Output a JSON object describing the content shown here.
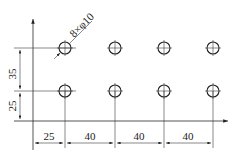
{
  "drawing": {
    "title": "Hole pattern dimension drawing",
    "hole_callout": "8×φ10",
    "hole_count": 8,
    "hole_diameter": "φ10",
    "horizontal_dimensions": [
      "25",
      "40",
      "40",
      "40"
    ],
    "vertical_dimensions": [
      "25",
      "35"
    ],
    "rows": 2,
    "columns": 4,
    "line_color": "#2a2a2a",
    "background": "#ffffff"
  }
}
